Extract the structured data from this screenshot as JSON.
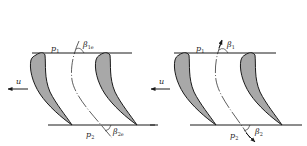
{
  "colors": {
    "line": "#1a1a1a",
    "blade_fill": "#a8a8a8",
    "background": "#ffffff"
  },
  "panels": [
    {
      "id": "left",
      "inlet_pressure": {
        "symbol": "p",
        "sub": "1"
      },
      "outlet_pressure": {
        "symbol": "p",
        "sub": "2"
      },
      "inlet_angle": {
        "symbol": "β",
        "sub": "1e"
      },
      "outlet_angle": {
        "symbol": "β",
        "sub": "2e"
      },
      "velocity": {
        "symbol": "u"
      }
    },
    {
      "id": "right",
      "inlet_pressure": {
        "symbol": "p",
        "sub": "1"
      },
      "outlet_pressure": {
        "symbol": "p",
        "sub": "2"
      },
      "inlet_angle": {
        "symbol": "β",
        "sub": "1"
      },
      "outlet_angle": {
        "symbol": "β",
        "sub": "2"
      },
      "velocity": {
        "symbol": "u"
      }
    }
  ]
}
